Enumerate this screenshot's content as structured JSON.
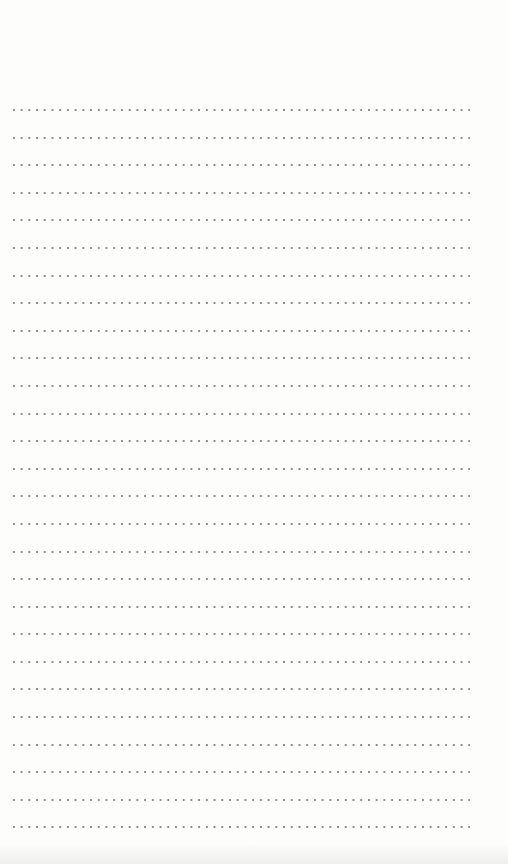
{
  "page": {
    "type": "dotted-ruled-paper",
    "background_color": "#fdfdfc",
    "dot_color": "#8c8c8c",
    "line_count": 27,
    "line_spacing_px": 27.6,
    "first_line_y_px": 109,
    "dots_start_x_px": 10,
    "dots_end_x_px": 468
  }
}
